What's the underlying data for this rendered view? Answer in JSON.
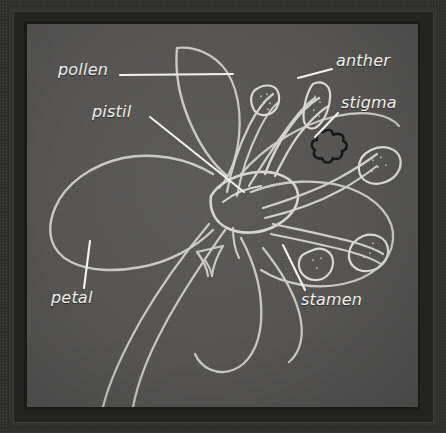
{
  "diagram": {
    "style": "chalkboard-line-drawing",
    "background_color": "#555453",
    "frame_color": "#30302f",
    "line_color": "#c9c8c4",
    "accent_dark_color": "#1b1b1a",
    "label_color": "#f2f1ee"
  },
  "labels": [
    {
      "id": "pollen",
      "text": "pollen",
      "x": 58,
      "y": 68,
      "pointer_from": [
        120,
        75
      ],
      "pointer_to": [
        233,
        74
      ]
    },
    {
      "id": "pistil",
      "text": "pistil",
      "x": 92,
      "y": 110,
      "pointer_from": [
        150,
        117
      ],
      "pointer_to": [
        244,
        192
      ]
    },
    {
      "id": "anther",
      "text": "anther",
      "x": 336,
      "y": 59,
      "pointer_from": [
        332,
        69
      ],
      "pointer_to": [
        298,
        78
      ]
    },
    {
      "id": "stigma",
      "text": "stigma",
      "x": 341,
      "y": 101,
      "pointer_from": [
        338,
        113
      ],
      "pointer_to": [
        315,
        137
      ]
    },
    {
      "id": "petal",
      "text": "petal",
      "x": 51,
      "y": 296,
      "pointer_from": [
        84,
        288
      ],
      "pointer_to": [
        90,
        241
      ]
    },
    {
      "id": "stamen",
      "text": "stamen",
      "x": 301,
      "y": 298,
      "pointer_from": [
        305,
        290
      ],
      "pointer_to": [
        283,
        245
      ]
    }
  ],
  "parts": [
    {
      "name": "pollen",
      "description": "grains on the anther sac"
    },
    {
      "name": "pistil",
      "description": "central ovary and style of the flower"
    },
    {
      "name": "anther",
      "description": "pollen-bearing sac at the tip of the stamen"
    },
    {
      "name": "stigma",
      "description": "dark sticky tip of the pistil"
    },
    {
      "name": "petal",
      "description": "large outer flower leaf"
    },
    {
      "name": "stamen",
      "description": "filament carrying the anther"
    }
  ]
}
